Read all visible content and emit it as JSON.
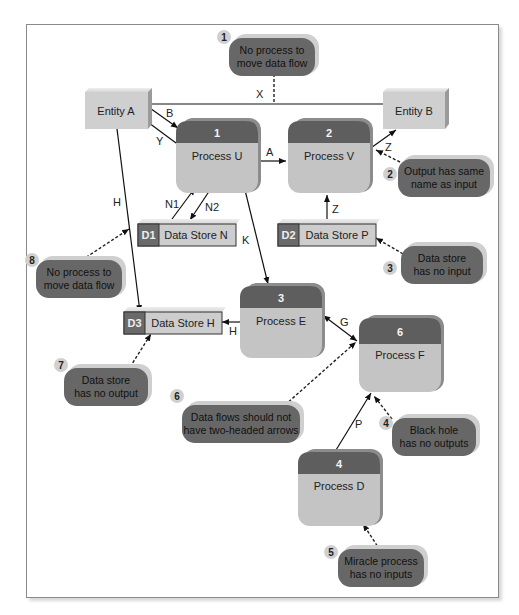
{
  "colors": {
    "process_header": "#5e5e5e",
    "process_body": "#c4c4c4",
    "entity": "#cfcfcf",
    "datastore_id": "#6a6a6a",
    "datastore_body": "#cdcdcd",
    "note_bubble": "#676767",
    "badge": "#d0d0d0"
  },
  "entities": [
    {
      "id": "entity-a",
      "label": "Entity A"
    },
    {
      "id": "entity-b",
      "label": "Entity B"
    }
  ],
  "processes": [
    {
      "number": "1",
      "label": "Process U"
    },
    {
      "number": "2",
      "label": "Process V"
    },
    {
      "number": "3",
      "label": "Process E"
    },
    {
      "number": "6",
      "label": "Process F"
    },
    {
      "number": "4",
      "label": "Process D"
    }
  ],
  "data_stores": [
    {
      "id": "D1",
      "label": "Data Store N"
    },
    {
      "id": "D2",
      "label": "Data Store P"
    },
    {
      "id": "D3",
      "label": "Data Store H"
    }
  ],
  "flows": [
    {
      "label": "X",
      "from": "Entity A",
      "to": "Entity B"
    },
    {
      "label": "B",
      "from": "Entity A",
      "to": "Process U"
    },
    {
      "label": "Y",
      "from": "Process U",
      "to": "Entity A"
    },
    {
      "label": "A",
      "from": "Process U",
      "to": "Process V"
    },
    {
      "label": "Z",
      "from": "Process V",
      "to": "Entity B"
    },
    {
      "label": "Z",
      "from": "Data Store P",
      "to": "Process V"
    },
    {
      "label": "N1",
      "from": "Data Store N",
      "to": "Process U"
    },
    {
      "label": "N2",
      "from": "Process U",
      "to": "Data Store N"
    },
    {
      "label": "H",
      "from": "Entity A",
      "to": "Data Store H"
    },
    {
      "label": "K",
      "from": "Process U",
      "to": "Process E"
    },
    {
      "label": "H",
      "from": "Process E",
      "to": "Data Store H"
    },
    {
      "label": "G",
      "from": "Process E",
      "to": "Process F",
      "two_headed": true
    },
    {
      "label": "P",
      "from": "Process D",
      "to": "Process F"
    }
  ],
  "notes": [
    {
      "badge": "1",
      "line1": "No process to",
      "line2": "move data flow"
    },
    {
      "badge": "2",
      "line1": "Output has same",
      "line2": "name as input"
    },
    {
      "badge": "3",
      "line1": "Data store",
      "line2": "has no input"
    },
    {
      "badge": "4",
      "line1": "Black hole",
      "line2": "has no outputs"
    },
    {
      "badge": "5",
      "line1": "Miracle process",
      "line2": "has no inputs"
    },
    {
      "badge": "6",
      "line1": "Data flows should not",
      "line2": "have two-headed arrows"
    },
    {
      "badge": "7",
      "line1": "Data store",
      "line2": "has no output"
    },
    {
      "badge": "8",
      "line1": "No process to",
      "line2": "move data flow"
    }
  ]
}
